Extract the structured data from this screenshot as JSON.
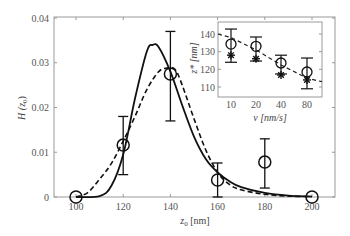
{
  "chart_data": [
    {
      "type": "line",
      "title": "",
      "xlabel": "z0 [nm]",
      "ylabel": "H(z0)",
      "xlim": [
        90,
        210
      ],
      "ylim": [
        0,
        0.04
      ],
      "xticks": [
        100,
        120,
        140,
        160,
        180,
        200
      ],
      "yticks": [
        0,
        0.01,
        0.02,
        0.03,
        0.04
      ],
      "xtick_labels": [
        "100",
        "120",
        "140",
        "160",
        "180",
        "200"
      ],
      "ytick_labels": [
        "0",
        "0.01",
        "0.02",
        "0.03",
        "0.04"
      ],
      "grid": false,
      "legend": null,
      "series": [
        {
          "name": "data (circles with error bars)",
          "style": "markers",
          "x": [
            100,
            120,
            140,
            160,
            180,
            200
          ],
          "y": [
            0.0,
            0.0116,
            0.0275,
            0.0038,
            0.0078,
            0.0
          ],
          "err_low": [
            0.0,
            0.005,
            0.017,
            0.0,
            0.002,
            0.0
          ],
          "err_high": [
            0.0,
            0.018,
            0.037,
            0.0076,
            0.013,
            0.0
          ]
        },
        {
          "name": "solid curve",
          "style": "solid",
          "x": [
            90,
            100,
            110,
            115,
            120,
            125,
            130,
            132.5,
            135,
            140,
            145,
            150,
            155,
            160,
            165,
            170,
            180,
            190,
            200,
            210
          ],
          "y": [
            0.0,
            0.0,
            0.0002,
            0.0025,
            0.0095,
            0.022,
            0.0325,
            0.034,
            0.0335,
            0.028,
            0.0205,
            0.0135,
            0.0085,
            0.0055,
            0.0035,
            0.0022,
            0.0009,
            0.0003,
            0.0001,
            0.0
          ]
        },
        {
          "name": "dashed curve",
          "style": "dashed",
          "x": [
            90,
            100,
            105,
            110,
            115,
            120,
            125,
            130,
            135,
            138.5,
            142,
            145,
            150,
            155,
            160,
            165,
            170,
            180,
            190,
            200,
            210
          ],
          "y": [
            0.0,
            0.0,
            0.001,
            0.004,
            0.0075,
            0.0125,
            0.018,
            0.024,
            0.028,
            0.0288,
            0.0285,
            0.025,
            0.0175,
            0.0105,
            0.0055,
            0.0028,
            0.0016,
            0.0006,
            0.0002,
            0.0001,
            0.0
          ]
        }
      ]
    },
    {
      "type": "scatter",
      "title": "inset",
      "xlabel": "v [nm/s]",
      "ylabel": "z* [nm]",
      "categories": [
        "10",
        "20",
        "40",
        "80"
      ],
      "yticks": [
        110,
        120,
        130,
        140
      ],
      "ylim": [
        105,
        145
      ],
      "series": [
        {
          "name": "circles with error bars",
          "values": [
            134.3,
            133,
            123.6,
            118.5
          ],
          "err_low": [
            124,
            124.7,
            117.4,
            109
          ],
          "err_high": [
            142.8,
            138.3,
            128,
            126.4
          ]
        },
        {
          "name": "stars",
          "values": [
            128,
            126,
            116.8,
            114
          ]
        },
        {
          "name": "dashed fit",
          "style": "dashed",
          "values": [
            138,
            131,
            122.5,
            115
          ]
        }
      ]
    }
  ],
  "labels": {
    "main_xlabel_var": "z",
    "main_xlabel_sub": "0",
    "main_xlabel_unit": " [nm]",
    "main_ylabel": "H (z",
    "main_ylabel_sub": "0",
    "main_ylabel_end": ")",
    "inset_xlabel": "v [nm/s]",
    "inset_ylabel": "z* [nm]"
  }
}
